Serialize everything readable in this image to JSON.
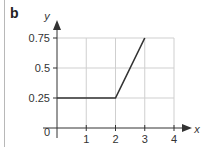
{
  "panel": {
    "label": "b"
  },
  "chart_data": {
    "type": "line",
    "title": "",
    "xlabel": "x",
    "ylabel": "y",
    "xlim": [
      0,
      4
    ],
    "ylim": [
      0,
      0.75
    ],
    "grid": true,
    "x_ticks": [
      1,
      2,
      3,
      4
    ],
    "x_tick_labels": [
      "1",
      "2",
      "3",
      "4"
    ],
    "y_ticks": [
      0.25,
      0.5,
      0.75
    ],
    "y_tick_labels": [
      "0.25",
      "0.5",
      "0.75"
    ],
    "origin_label": "0",
    "series": [
      {
        "name": "y",
        "x": [
          0,
          2,
          3
        ],
        "y": [
          0.25,
          0.25,
          0.75
        ],
        "color": "#333333"
      }
    ]
  }
}
